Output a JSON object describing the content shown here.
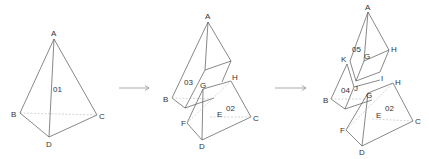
{
  "figure": {
    "colors": {
      "edge": "#555555",
      "hidden_edge": "#bbbbbb",
      "arrow": "#888888",
      "text": "#333333"
    },
    "stage1": {
      "piece_labels": {
        "p01": "01"
      },
      "vertices": {
        "A": "A",
        "B": "B",
        "C": "C",
        "D": "D"
      }
    },
    "stage2": {
      "piece_labels": {
        "p03": "03",
        "p02": "02"
      },
      "vertices": {
        "A": "A",
        "B": "B",
        "C": "C",
        "D": "D",
        "E": "E",
        "F": "F",
        "G": "G",
        "H": "H"
      }
    },
    "stage3": {
      "piece_labels": {
        "p05": "05",
        "p04": "04",
        "p02": "02"
      },
      "vertices": {
        "A": "A",
        "B": "B",
        "C": "C",
        "D": "D",
        "E": "E",
        "F": "F",
        "G_upper": "G",
        "H_upper": "H",
        "G_lower": "G",
        "H_lower": "H",
        "I": "I",
        "J": "J",
        "K": "K"
      }
    },
    "arrows": [
      "stage1-to-stage2",
      "stage2-to-stage3"
    ]
  }
}
